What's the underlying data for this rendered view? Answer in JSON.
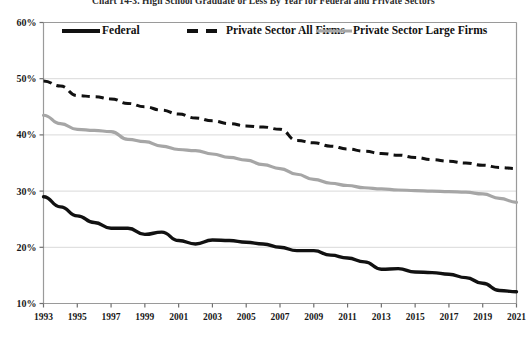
{
  "chart_data": {
    "type": "line",
    "title": "Chart 14-3.  High School Graduate or Less By Year for Federal and Private Sectors",
    "xlabel": "",
    "ylabel": "",
    "grid": true,
    "legend_position": "top-inside",
    "xlim": [
      1993,
      2021
    ],
    "ylim": [
      10,
      60
    ],
    "ytick_labels": [
      "60%",
      "50%",
      "40%",
      "30%",
      "20%",
      "10%"
    ],
    "ytick_values": [
      60,
      50,
      40,
      30,
      20,
      10
    ],
    "x": [
      1993,
      1994,
      1995,
      1996,
      1997,
      1998,
      1999,
      2000,
      2001,
      2002,
      2003,
      2004,
      2005,
      2006,
      2007,
      2008,
      2009,
      2010,
      2011,
      2012,
      2013,
      2014,
      2015,
      2016,
      2017,
      2018,
      2019,
      2020,
      2021
    ],
    "xtick_labels": [
      "1993",
      "1995",
      "1997",
      "1999",
      "2001",
      "2003",
      "2005",
      "2007",
      "2009",
      "2011",
      "2013",
      "2015",
      "2017",
      "2019",
      "2021"
    ],
    "xtick_values": [
      1993,
      1995,
      1997,
      1999,
      2001,
      2003,
      2005,
      2007,
      2009,
      2011,
      2013,
      2015,
      2017,
      2019,
      2021
    ],
    "series": [
      {
        "name": "Federal",
        "style": "solid",
        "color": "#111111",
        "width": 3.4,
        "values": [
          29.0,
          27.2,
          25.6,
          24.4,
          23.4,
          23.4,
          22.3,
          22.7,
          21.2,
          20.6,
          21.3,
          21.2,
          20.9,
          20.6,
          20.0,
          19.4,
          19.4,
          18.6,
          18.1,
          17.4,
          16.1,
          16.2,
          15.6,
          15.5,
          15.2,
          14.6,
          13.6,
          12.3,
          12.1
        ]
      },
      {
        "name": "Private Sector All Firms",
        "style": "dashed",
        "color": "#111111",
        "width": 3.0,
        "values": [
          49.6,
          48.7,
          47.0,
          46.8,
          46.4,
          45.6,
          45.0,
          44.4,
          43.7,
          43.0,
          42.5,
          42.0,
          41.6,
          41.4,
          41.0,
          39.0,
          38.6,
          38.0,
          37.5,
          37.1,
          36.7,
          36.4,
          36.0,
          35.6,
          35.3,
          35.0,
          34.6,
          34.2,
          34.0
        ]
      },
      {
        "name": "Private Sector Large Firms",
        "style": "solid",
        "color": "#a6a6a6",
        "width": 3.2,
        "values": [
          43.5,
          42.0,
          41.0,
          40.8,
          40.6,
          39.2,
          38.8,
          38.0,
          37.4,
          37.2,
          36.6,
          36.0,
          35.5,
          34.7,
          34.0,
          33.0,
          32.1,
          31.4,
          31.0,
          30.6,
          30.4,
          30.2,
          30.1,
          30.0,
          29.9,
          29.8,
          29.5,
          28.7,
          28.0
        ]
      }
    ],
    "legend": [
      {
        "label": "Federal",
        "style": "solid",
        "color": "#111111"
      },
      {
        "label": "Private Sector All Firms",
        "style": "dashed",
        "color": "#111111"
      },
      {
        "label": "Private Sector Large Firms",
        "style": "solid",
        "color": "#a6a6a6"
      }
    ]
  }
}
